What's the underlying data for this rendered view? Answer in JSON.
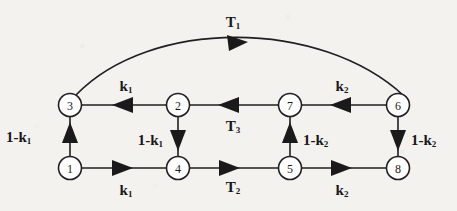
{
  "diagram": {
    "type": "directed-graph",
    "title": "",
    "background_color": "#f4f2ee",
    "line_color": "#1f1f1f",
    "node_fill": "#ffffff",
    "nodes": [
      {
        "id": "1",
        "label": "1",
        "x": 70,
        "y": 168
      },
      {
        "id": "2",
        "label": "2",
        "x": 178,
        "y": 105
      },
      {
        "id": "3",
        "label": "3",
        "x": 70,
        "y": 105
      },
      {
        "id": "4",
        "label": "4",
        "x": 178,
        "y": 168
      },
      {
        "id": "5",
        "label": "5",
        "x": 290,
        "y": 168
      },
      {
        "id": "6",
        "label": "6",
        "x": 398,
        "y": 105
      },
      {
        "id": "7",
        "label": "7",
        "x": 290,
        "y": 105
      },
      {
        "id": "8",
        "label": "8",
        "x": 398,
        "y": 168
      }
    ],
    "edges": [
      {
        "id": "e-1-3",
        "from": "1",
        "to": "3",
        "shape": "straight",
        "direction": "up",
        "label": "1-k",
        "sub": "1"
      },
      {
        "id": "e-1-4",
        "from": "1",
        "to": "4",
        "shape": "straight",
        "direction": "right",
        "label": "k",
        "sub": "1"
      },
      {
        "id": "e-2-3",
        "from": "2",
        "to": "3",
        "shape": "straight",
        "direction": "left",
        "label": "k",
        "sub": "1"
      },
      {
        "id": "e-2-4",
        "from": "2",
        "to": "4",
        "shape": "straight",
        "direction": "down",
        "label": "1-k",
        "sub": "1"
      },
      {
        "id": "e-4-5",
        "from": "4",
        "to": "5",
        "shape": "straight",
        "direction": "right",
        "label": "T",
        "sub": "2"
      },
      {
        "id": "e-7-2",
        "from": "7",
        "to": "2",
        "shape": "straight",
        "direction": "left",
        "label": "T",
        "sub": "3"
      },
      {
        "id": "e-5-7",
        "from": "5",
        "to": "7",
        "shape": "straight",
        "direction": "up",
        "label": "1-k",
        "sub": "2"
      },
      {
        "id": "e-5-8",
        "from": "5",
        "to": "8",
        "shape": "straight",
        "direction": "right",
        "label": "k",
        "sub": "2"
      },
      {
        "id": "e-6-7",
        "from": "6",
        "to": "7",
        "shape": "straight",
        "direction": "left",
        "label": "k",
        "sub": "2"
      },
      {
        "id": "e-6-8",
        "from": "6",
        "to": "8",
        "shape": "straight",
        "direction": "down",
        "label": "1-k",
        "sub": "2"
      },
      {
        "id": "e-3-6",
        "from": "3",
        "to": "6",
        "shape": "arc",
        "direction": "right",
        "label": "T",
        "sub": "1"
      }
    ],
    "labels": {
      "t1": {
        "text": "T",
        "sub": "1",
        "x": 233,
        "y": 22
      },
      "t2": {
        "text": "T",
        "sub": "2",
        "x": 233,
        "y": 187
      },
      "t3": {
        "text": "T",
        "sub": "3",
        "x": 233,
        "y": 126
      },
      "k1_top": {
        "text": "k",
        "sub": "1",
        "x": 126,
        "y": 86
      },
      "k1_bottom": {
        "text": "k",
        "sub": "1",
        "x": 126,
        "y": 190
      },
      "k2_top": {
        "text": "k",
        "sub": "2",
        "x": 342,
        "y": 86
      },
      "k2_bottom": {
        "text": "k",
        "sub": "2",
        "x": 342,
        "y": 190
      },
      "one_k1_left": {
        "text": "1-k",
        "sub": "1",
        "x": 11,
        "y": 137,
        "align": "start"
      },
      "one_k1_mid": {
        "text": "1-k",
        "sub": "1",
        "x": 162,
        "y": 140,
        "align": "end"
      },
      "one_k2_mid": {
        "text": "1-k",
        "sub": "2",
        "x": 305,
        "y": 140,
        "align": "start"
      },
      "one_k2_right": {
        "text": "1-k",
        "sub": "2",
        "x": 412,
        "y": 140,
        "align": "start"
      }
    }
  }
}
